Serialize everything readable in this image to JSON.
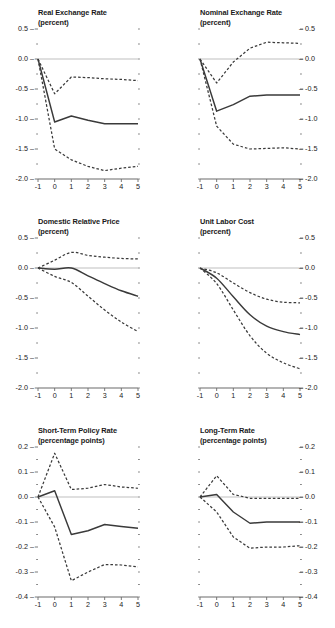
{
  "figure": {
    "rows": 3,
    "cols": 2,
    "background": "#ffffff",
    "line_color": "#3a3a3a",
    "zero_line_color": "#b8b8b8",
    "axis_color": "#6b6b6b",
    "text_color": "#1a1a1a"
  },
  "chart_data": [
    {
      "type": "line",
      "title": "Real Exchange Rate",
      "subtitle": "(percent)",
      "xlabel": "",
      "ylabel": "",
      "unit": "percent",
      "grid": false,
      "legend": "none",
      "zero_line": true,
      "x": [
        -1,
        0,
        1,
        2,
        3,
        4,
        5
      ],
      "xlim": [
        -1,
        5
      ],
      "ylim": [
        -2.0,
        0.5
      ],
      "yticks": [
        0.5,
        0.0,
        -0.5,
        -1.0,
        -1.5,
        -2.0
      ],
      "ytick_labels": [
        "0.5",
        "0.0",
        "-0.5",
        "-1.0",
        "-1.5",
        "-2.0"
      ],
      "xticks": [
        -1,
        0,
        1,
        2,
        3,
        4,
        5
      ],
      "xtick_labels": [
        "-1",
        "0",
        "1",
        "2",
        "3",
        "4",
        "5"
      ],
      "minor_yticks": [
        0.25,
        -0.25,
        -0.75,
        -1.25,
        -1.75
      ],
      "y_axis_side": "left",
      "series": [
        {
          "name": "point estimate",
          "style": "solid",
          "values": [
            0.0,
            -1.05,
            -0.95,
            -1.02,
            -1.08,
            -1.08,
            -1.08
          ]
        },
        {
          "name": "upper confidence band",
          "style": "dashed",
          "values": [
            0.0,
            -0.58,
            -0.3,
            -0.31,
            -0.33,
            -0.34,
            -0.36
          ]
        },
        {
          "name": "lower confidence band",
          "style": "dashed",
          "values": [
            0.0,
            -1.5,
            -1.68,
            -1.79,
            -1.86,
            -1.82,
            -1.79
          ]
        }
      ]
    },
    {
      "type": "line",
      "title": "Nominal Exchange Rate",
      "subtitle": "(percent)",
      "xlabel": "",
      "ylabel": "",
      "unit": "percent",
      "grid": false,
      "legend": "none",
      "zero_line": true,
      "x": [
        -1,
        0,
        1,
        2,
        3,
        4,
        5
      ],
      "xlim": [
        -1,
        5
      ],
      "ylim": [
        -2.0,
        0.5
      ],
      "yticks": [
        0.5,
        0.0,
        -0.5,
        -1.0,
        -1.5,
        -2.0
      ],
      "ytick_labels": [
        "0.5",
        "0.0",
        "-0.5",
        "-1.0",
        "-1.5",
        "-2.0"
      ],
      "xticks": [
        -1,
        0,
        1,
        2,
        3,
        4,
        5
      ],
      "xtick_labels": [
        "-1",
        "0",
        "1",
        "2",
        "3",
        "4",
        "5"
      ],
      "minor_yticks": [
        0.25,
        -0.25,
        -0.75,
        -1.25,
        -1.75
      ],
      "y_axis_side": "right",
      "series": [
        {
          "name": "point estimate",
          "style": "solid",
          "values": [
            0.0,
            -0.87,
            -0.76,
            -0.62,
            -0.6,
            -0.6,
            -0.6
          ]
        },
        {
          "name": "upper confidence band",
          "style": "dashed",
          "values": [
            0.0,
            -0.4,
            -0.05,
            0.18,
            0.28,
            0.27,
            0.26
          ]
        },
        {
          "name": "lower confidence band",
          "style": "dashed",
          "values": [
            0.0,
            -1.12,
            -1.42,
            -1.5,
            -1.49,
            -1.48,
            -1.5
          ]
        }
      ]
    },
    {
      "type": "line",
      "title": "Domestic Relative Price",
      "subtitle": "(percent)",
      "xlabel": "",
      "ylabel": "",
      "unit": "percent",
      "grid": false,
      "legend": "none",
      "zero_line": true,
      "x": [
        -1,
        0,
        1,
        2,
        3,
        4,
        5
      ],
      "xlim": [
        -1,
        5
      ],
      "ylim": [
        -2.0,
        0.5
      ],
      "yticks": [
        0.5,
        0.0,
        -0.5,
        -1.0,
        -1.5,
        -2.0
      ],
      "ytick_labels": [
        "0.5",
        "0.0",
        "-0.5",
        "-1.0",
        "-1.5",
        "-2.0"
      ],
      "xticks": [
        -1,
        0,
        1,
        2,
        3,
        4,
        5
      ],
      "xtick_labels": [
        "-1",
        "0",
        "1",
        "2",
        "3",
        "4",
        "5"
      ],
      "minor_yticks": [
        0.25,
        -0.25,
        -0.75,
        -1.25,
        -1.75
      ],
      "y_axis_side": "left",
      "series": [
        {
          "name": "point estimate",
          "style": "solid",
          "values": [
            0.0,
            -0.02,
            0.0,
            -0.13,
            -0.26,
            -0.38,
            -0.47
          ]
        },
        {
          "name": "upper confidence band",
          "style": "dashed",
          "values": [
            0.0,
            0.13,
            0.26,
            0.21,
            0.18,
            0.16,
            0.15
          ]
        },
        {
          "name": "lower confidence band",
          "style": "dashed",
          "values": [
            0.0,
            -0.14,
            -0.24,
            -0.47,
            -0.7,
            -0.9,
            -1.06
          ]
        }
      ]
    },
    {
      "type": "line",
      "title": "Unit Labor Cost",
      "subtitle": "(percent)",
      "xlabel": "",
      "ylabel": "",
      "unit": "percent",
      "grid": false,
      "legend": "none",
      "zero_line": true,
      "x": [
        -1,
        0,
        1,
        2,
        3,
        4,
        5
      ],
      "xlim": [
        -1,
        5
      ],
      "ylim": [
        -2.0,
        0.5
      ],
      "yticks": [
        0.5,
        0.0,
        -0.5,
        -1.0,
        -1.5,
        -2.0
      ],
      "ytick_labels": [
        "0.5",
        "0.0",
        "-0.5",
        "-1.0",
        "-1.5",
        "-2.0"
      ],
      "xticks": [
        -1,
        0,
        1,
        2,
        3,
        4,
        5
      ],
      "xtick_labels": [
        "-1",
        "0",
        "1",
        "2",
        "3",
        "4",
        "5"
      ],
      "minor_yticks": [
        0.25,
        -0.25,
        -0.75,
        -1.25,
        -1.75
      ],
      "y_axis_side": "right",
      "series": [
        {
          "name": "point estimate",
          "style": "solid",
          "values": [
            0.0,
            -0.17,
            -0.48,
            -0.78,
            -0.97,
            -1.06,
            -1.11
          ]
        },
        {
          "name": "upper confidence band",
          "style": "dashed",
          "values": [
            0.0,
            -0.08,
            -0.25,
            -0.41,
            -0.52,
            -0.57,
            -0.58
          ]
        },
        {
          "name": "lower confidence band",
          "style": "dashed",
          "values": [
            0.0,
            -0.26,
            -0.7,
            -1.13,
            -1.42,
            -1.58,
            -1.68
          ]
        }
      ]
    },
    {
      "type": "line",
      "title": "Short-Term Policy Rate",
      "subtitle": "(percentage points)",
      "xlabel": "",
      "ylabel": "",
      "unit": "percentage points",
      "grid": false,
      "legend": "none",
      "zero_line": true,
      "x": [
        -1,
        0,
        1,
        2,
        3,
        4,
        5
      ],
      "xlim": [
        -1,
        5
      ],
      "ylim": [
        -0.4,
        0.2
      ],
      "yticks": [
        0.2,
        0.1,
        0.0,
        -0.1,
        -0.2,
        -0.3,
        -0.4
      ],
      "ytick_labels": [
        "0.2",
        "0.1",
        "0.0",
        "-0.1",
        "-0.2",
        "-0.3",
        "-0.4"
      ],
      "xticks": [
        -1,
        0,
        1,
        2,
        3,
        4,
        5
      ],
      "xtick_labels": [
        "-1",
        "0",
        "1",
        "2",
        "3",
        "4",
        "5"
      ],
      "minor_yticks": [
        0.15,
        0.05,
        -0.05,
        -0.15,
        -0.25,
        -0.35
      ],
      "y_axis_side": "left",
      "series": [
        {
          "name": "point estimate",
          "style": "solid",
          "values": [
            0.0,
            0.025,
            -0.15,
            -0.135,
            -0.11,
            -0.118,
            -0.125
          ]
        },
        {
          "name": "upper confidence band",
          "style": "dashed",
          "values": [
            0.0,
            0.175,
            0.03,
            0.035,
            0.05,
            0.04,
            0.035
          ]
        },
        {
          "name": "lower confidence band",
          "style": "dashed",
          "values": [
            0.0,
            -0.12,
            -0.335,
            -0.3,
            -0.27,
            -0.272,
            -0.28
          ]
        }
      ]
    },
    {
      "type": "line",
      "title": "Long-Term Rate",
      "subtitle": "(percentage points)",
      "xlabel": "",
      "ylabel": "",
      "unit": "percentage points",
      "grid": false,
      "legend": "none",
      "zero_line": true,
      "x": [
        -1,
        0,
        1,
        2,
        3,
        4,
        5
      ],
      "xlim": [
        -0.4,
        0.2
      ],
      "ylim": [
        -0.4,
        0.2
      ],
      "yticks": [
        0.2,
        0.1,
        0.0,
        -0.1,
        -0.2,
        -0.3,
        -0.4
      ],
      "ytick_labels": [
        "0.2",
        "0.1",
        "0.0",
        "-0.1",
        "-0.2",
        "-0.3",
        "-0.4"
      ],
      "xticks": [
        -1,
        0,
        1,
        2,
        3,
        4,
        5
      ],
      "xtick_labels": [
        "-1",
        "0",
        "1",
        "2",
        "3",
        "4",
        "5"
      ],
      "minor_yticks": [
        0.15,
        0.05,
        -0.05,
        -0.15,
        -0.25,
        -0.35
      ],
      "y_axis_side": "right",
      "series": [
        {
          "name": "point estimate",
          "style": "solid",
          "values": [
            0.0,
            0.01,
            -0.06,
            -0.105,
            -0.1,
            -0.1,
            -0.1
          ]
        },
        {
          "name": "upper confidence band",
          "style": "dashed",
          "values": [
            0.0,
            0.085,
            0.01,
            -0.005,
            -0.005,
            -0.005,
            -0.005
          ]
        },
        {
          "name": "lower confidence band",
          "style": "dashed",
          "values": [
            0.0,
            -0.06,
            -0.16,
            -0.205,
            -0.2,
            -0.2,
            -0.195
          ]
        }
      ]
    }
  ]
}
